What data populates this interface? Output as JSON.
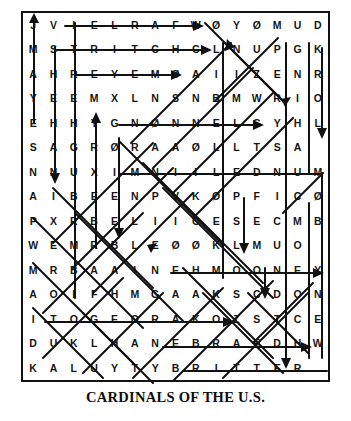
{
  "puzzle": {
    "title": "CARDINALS OF THE U.S.",
    "rows": 15,
    "cols": 15,
    "grid": [
      [
        "J",
        "V",
        "I",
        "E",
        "L",
        "R",
        "A",
        "F",
        "W",
        "Ø",
        "Y",
        "Ø",
        "M",
        "U",
        "D"
      ],
      [
        "M",
        "S",
        "T",
        "R",
        "I",
        "T",
        "C",
        "H",
        "C",
        "L",
        "N",
        "U",
        "P",
        "G",
        "K"
      ],
      [
        "A",
        "H",
        "R",
        "E",
        "Y",
        "E",
        "M",
        "Ø",
        "A",
        "I",
        "I",
        "Z",
        "E",
        "N",
        "R"
      ],
      [
        "Y",
        "E",
        "E",
        "M",
        "X",
        "L",
        "N",
        "S",
        "N",
        "B",
        "M",
        "W",
        "R",
        "I",
        "O"
      ],
      [
        "E",
        "H",
        "H",
        "Y",
        "G",
        "N",
        "Ø",
        "N",
        "N",
        "E",
        "L",
        "G",
        "Y",
        "H",
        "L"
      ],
      [
        "S",
        "A",
        "G",
        "R",
        "Ø",
        "R",
        "A",
        "A",
        "Ø",
        "L",
        "L",
        "T",
        "S",
        "A"
      ],
      [
        "N",
        "N",
        "U",
        "X",
        "I",
        "M",
        "N",
        "I",
        "I",
        "L",
        "E",
        "D",
        "N",
        "U",
        "M"
      ],
      [
        "A",
        "I",
        "B",
        "E",
        "E",
        "N",
        "P",
        "V",
        "K",
        "Ø",
        "P",
        "F",
        "I",
        "C",
        "Ø"
      ],
      [
        "P",
        "X",
        "R",
        "B",
        "E",
        "L",
        "I",
        "I",
        "C",
        "E",
        "S",
        "E",
        "C",
        "M",
        "B"
      ],
      [
        "W",
        "E",
        "M",
        "R",
        "B",
        "L",
        "E",
        "Ø",
        "Ø",
        "K",
        "L",
        "M",
        "U",
        "O"
      ],
      [
        "M",
        "R",
        "B",
        "A",
        "A",
        "I",
        "N",
        "E",
        "H",
        "M",
        "O",
        "O",
        "N",
        "E",
        "Y"
      ],
      [
        "A",
        "O",
        "I",
        "F",
        "H",
        "M",
        "G",
        "A",
        "A",
        "K",
        "S",
        "C",
        "D",
        "O",
        "N",
        "L"
      ],
      [
        "I",
        "T",
        "O",
        "G",
        "E",
        "O",
        "R",
        "A",
        "K",
        "O",
        "Z",
        "S",
        "T",
        "C",
        "E"
      ],
      [
        "D",
        "U",
        "K",
        "L",
        "H",
        "A",
        "N",
        "E",
        "B",
        "R",
        "A",
        "E",
        "D",
        "H",
        "W"
      ],
      [
        "K",
        "A",
        "L",
        "U",
        "Y",
        "T",
        "Y",
        "B",
        "R",
        "I",
        "T",
        "T",
        "E",
        "R"
      ]
    ],
    "colors": {
      "letters": "#141414",
      "lines": "#111111",
      "frame": "#111111",
      "background": "#ffffff"
    }
  }
}
